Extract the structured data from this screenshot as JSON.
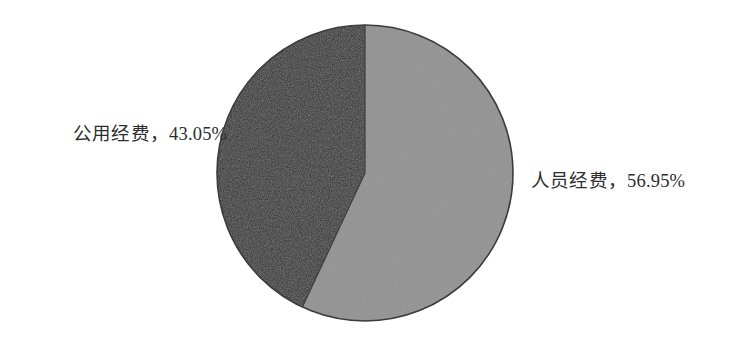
{
  "chart_data": {
    "type": "pie",
    "title": "",
    "subtitle": "",
    "xlabel": "",
    "ylabel": "",
    "grid": false,
    "legend_position": "outside-labels",
    "start_angle_deg": 0,
    "direction": "clockwise",
    "categories": [
      "人员经费",
      "公用经费"
    ],
    "values": [
      56.95,
      43.05
    ],
    "units": "%",
    "slices": [
      {
        "name": "人员经费",
        "value": 56.95,
        "value_text": "56.95%",
        "label_text": "人员经费，56.95%",
        "color": "#9a9a9a",
        "angle_deg": 205.0,
        "label_side": "right"
      },
      {
        "name": "公用经费",
        "value": 43.05,
        "value_text": "43.05%",
        "label_text": "公用经费，43.05%",
        "color": "#2a2a2a",
        "angle_deg": 155.0,
        "label_side": "left"
      }
    ],
    "annotations": []
  },
  "colors": {
    "background": "#ffffff",
    "slice_light": "#9a9a9a",
    "slice_dark": "#2a2a2a",
    "outline": "#3c3c3c",
    "label_text": "#2e2e2e"
  },
  "labels": {
    "left": "公用经费，43.05%",
    "right": "人员经费，56.95%"
  }
}
